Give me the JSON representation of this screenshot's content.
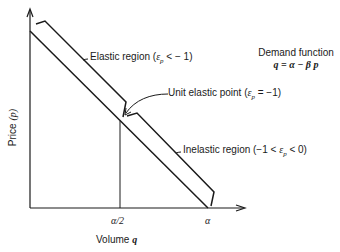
{
  "diagram": {
    "title": "Demand function",
    "equation": "q = α − β p",
    "axes": {
      "y_label": "Price (p)",
      "y_label_text": "Price",
      "y_label_var": "(p)",
      "x_label_text": "Volume",
      "x_label_var": "q",
      "x_ticks": [
        "α/2",
        "α"
      ]
    },
    "annotations": {
      "elastic": {
        "text": "Elastic region (",
        "eps": "ε",
        "sub": "p",
        "tail": " < − 1)"
      },
      "unit": {
        "text": "Unit elastic point (",
        "eps": "ε",
        "sub": "p",
        "tail": " = −1)"
      },
      "inelastic": {
        "text": "Inelastic region (−1 < ",
        "eps": "ε",
        "sub": "p",
        "tail": " < 0)"
      }
    },
    "colors": {
      "line": "#1a1a1a",
      "background": "#ffffff"
    }
  }
}
